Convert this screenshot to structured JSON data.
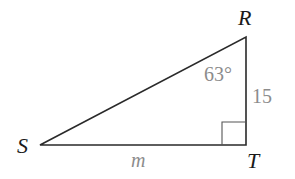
{
  "diagram": {
    "type": "right-triangle",
    "vertices": {
      "R": {
        "label": "R",
        "x": 246,
        "y": 37
      },
      "S": {
        "label": "S",
        "x": 40,
        "y": 145
      },
      "T": {
        "label": "T",
        "x": 246,
        "y": 145
      }
    },
    "angle_R": {
      "label": "63°"
    },
    "side_RT": {
      "label": "15"
    },
    "side_ST": {
      "label": "m"
    },
    "right_angle_at": "T",
    "colors": {
      "line": "#2a2a2a",
      "vertex_label": "#1a1a1a",
      "measure_label": "#8c8c8c"
    }
  }
}
